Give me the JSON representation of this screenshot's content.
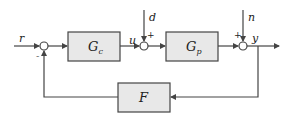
{
  "diagram": {
    "type": "feedback-control-block-diagram",
    "blocks": {
      "controller": {
        "main": "G",
        "sub": "c"
      },
      "plant": {
        "main": "G",
        "sub": "p"
      },
      "feedback": {
        "main": "F"
      }
    },
    "signals": {
      "reference": "r",
      "control": "u",
      "disturbance": "d",
      "noise": "n",
      "output": "y"
    },
    "signs": {
      "sum1_feedback": "-",
      "sum2_disturbance": "+",
      "sum3_noise": "+"
    },
    "colors": {
      "block_fill": "#e8e8e8",
      "line": "#444444"
    }
  }
}
